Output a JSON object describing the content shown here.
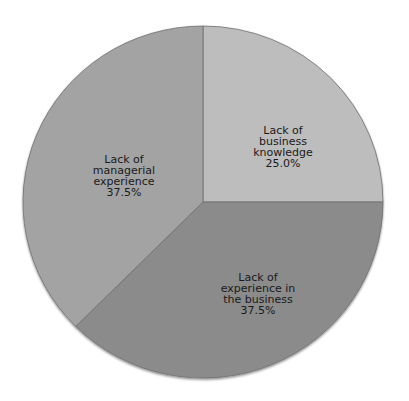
{
  "chart_data": {
    "type": "pie",
    "title": "",
    "start_angle_deg": 0,
    "direction": "clockwise",
    "slices": [
      {
        "label": "Lack of business knowledge",
        "label_lines": [
          "Lack of",
          "business",
          "knowledge"
        ],
        "value": 25.0,
        "value_text": "25.0%",
        "color": "#bdbdbd"
      },
      {
        "label": "Lack of experience in the business",
        "label_lines": [
          "Lack of",
          "experience in",
          "the business"
        ],
        "value": 37.5,
        "value_text": "37.5%",
        "color": "#8b8b8b"
      },
      {
        "label": "Lack of managerial experience",
        "label_lines": [
          "Lack of",
          "managerial",
          "experience"
        ],
        "value": 37.5,
        "value_text": "37.5%",
        "color": "#a3a3a3"
      }
    ]
  }
}
